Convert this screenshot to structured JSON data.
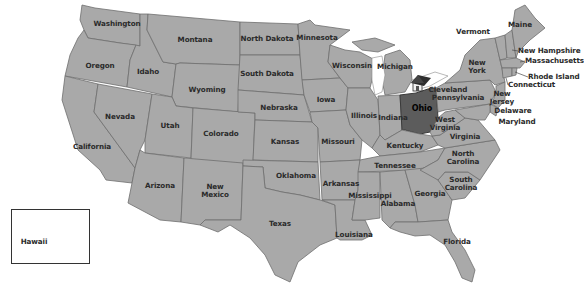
{
  "map": {
    "title": "United States map",
    "highlighted_state": "Ohio",
    "highlight_color": "#5c5c5c",
    "base_state_color": "#a9a9a9",
    "border_color": "#6e6e6e",
    "marker": {
      "icon": "house-icon",
      "near": "Ohio"
    },
    "city_label": "Cleveland",
    "inset": {
      "label": "Hawaii"
    }
  },
  "labels": [
    {
      "id": "washington",
      "text": "Washington",
      "x": 117,
      "y": 24
    },
    {
      "id": "montana",
      "text": "Montana",
      "x": 195,
      "y": 40
    },
    {
      "id": "north-dakota",
      "text": "North Dakota",
      "x": 267,
      "y": 39
    },
    {
      "id": "minnesota",
      "text": "Minnesota",
      "x": 317,
      "y": 38
    },
    {
      "id": "oregon",
      "text": "Oregon",
      "x": 100,
      "y": 66
    },
    {
      "id": "idaho",
      "text": "Idaho",
      "x": 148,
      "y": 72
    },
    {
      "id": "south-dakota",
      "text": "South Dakota",
      "x": 267,
      "y": 74
    },
    {
      "id": "wisconsin",
      "text": "Wisconsin",
      "x": 352,
      "y": 66
    },
    {
      "id": "michigan",
      "text": "Michigan",
      "x": 395,
      "y": 67
    },
    {
      "id": "wyoming",
      "text": "Wyoming",
      "x": 207,
      "y": 90
    },
    {
      "id": "nebraska",
      "text": "Nebraska",
      "x": 279,
      "y": 108
    },
    {
      "id": "iowa",
      "text": "Iowa",
      "x": 326,
      "y": 100
    },
    {
      "id": "nevada",
      "text": "Nevada",
      "x": 120,
      "y": 117
    },
    {
      "id": "utah",
      "text": "Utah",
      "x": 170,
      "y": 126
    },
    {
      "id": "colorado",
      "text": "Colorado",
      "x": 221,
      "y": 134
    },
    {
      "id": "illinois",
      "text": "Illinois",
      "x": 364,
      "y": 116
    },
    {
      "id": "indiana",
      "text": "Indiana",
      "x": 393,
      "y": 118
    },
    {
      "id": "ohio",
      "text": "Ohio",
      "x": 422,
      "y": 109
    },
    {
      "id": "kansas",
      "text": "Kansas",
      "x": 285,
      "y": 142
    },
    {
      "id": "missouri",
      "text": "Missouri",
      "x": 338,
      "y": 142
    },
    {
      "id": "kentucky",
      "text": "Kentucky",
      "x": 405,
      "y": 146
    },
    {
      "id": "west-virginia",
      "text": "West\nVirginia",
      "x": 445,
      "y": 124
    },
    {
      "id": "virginia",
      "text": "Virginia",
      "x": 465,
      "y": 137
    },
    {
      "id": "california",
      "text": "California",
      "x": 92,
      "y": 147
    },
    {
      "id": "tennessee",
      "text": "Tennessee",
      "x": 395,
      "y": 166
    },
    {
      "id": "north-carolina",
      "text": "North\nCarolina",
      "x": 463,
      "y": 158
    },
    {
      "id": "oklahoma",
      "text": "Oklahoma",
      "x": 296,
      "y": 176
    },
    {
      "id": "arkansas",
      "text": "Arkansas",
      "x": 341,
      "y": 184
    },
    {
      "id": "arizona",
      "text": "Arizona",
      "x": 160,
      "y": 186
    },
    {
      "id": "new-mexico",
      "text": "New\nMexico",
      "x": 215,
      "y": 191
    },
    {
      "id": "south-carolina",
      "text": "South\nCarolina",
      "x": 461,
      "y": 184
    },
    {
      "id": "mississippi",
      "text": "Mississippi",
      "x": 370,
      "y": 196
    },
    {
      "id": "georgia",
      "text": "Georgia",
      "x": 430,
      "y": 194
    },
    {
      "id": "alabama",
      "text": "Alabama",
      "x": 398,
      "y": 204
    },
    {
      "id": "texas",
      "text": "Texas",
      "x": 280,
      "y": 224
    },
    {
      "id": "louisiana",
      "text": "Louisiana",
      "x": 354,
      "y": 235
    },
    {
      "id": "florida",
      "text": "Florida",
      "x": 457,
      "y": 242
    },
    {
      "id": "hawaii",
      "text": "Hawaii",
      "x": 34,
      "y": 242
    },
    {
      "id": "pennsylvania",
      "text": "Pennsylvania",
      "x": 458,
      "y": 98
    },
    {
      "id": "new-york",
      "text": "New\nYork",
      "x": 477,
      "y": 67
    },
    {
      "id": "vermont",
      "text": "Vermont",
      "x": 473,
      "y": 32
    },
    {
      "id": "maine",
      "text": "Maine",
      "x": 520,
      "y": 25
    },
    {
      "id": "new-jersey",
      "text": "New\nJersey",
      "x": 502,
      "y": 98
    },
    {
      "id": "delaware",
      "text": "Delaware",
      "x": 513,
      "y": 111
    },
    {
      "id": "maryland",
      "text": "Maryland",
      "x": 517,
      "y": 122
    },
    {
      "id": "new-hampshire",
      "text": "New Hampshire",
      "x": 518,
      "y": 51,
      "anchor": "left"
    },
    {
      "id": "massachusetts",
      "text": "Massachusetts",
      "x": 525,
      "y": 61,
      "anchor": "left"
    },
    {
      "id": "rhode-island",
      "text": "Rhode Island",
      "x": 528,
      "y": 77,
      "anchor": "left"
    },
    {
      "id": "connecticut",
      "text": "Connecticut",
      "x": 508,
      "y": 85,
      "anchor": "left"
    }
  ],
  "city": {
    "text": "Cleveland",
    "x": 448,
    "y": 90
  }
}
